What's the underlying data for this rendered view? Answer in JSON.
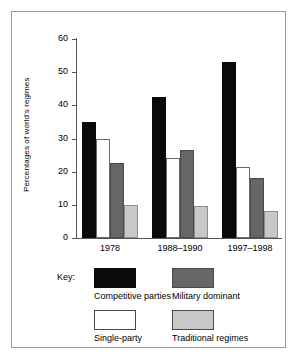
{
  "chart_data": {
    "type": "bar",
    "title": "",
    "xlabel": "",
    "ylabel": "Percentages of world's regimes",
    "categories": [
      "1978",
      "1988–1990",
      "1997–1998"
    ],
    "ylim": [
      0,
      60
    ],
    "yticks": [
      0,
      10,
      20,
      30,
      40,
      50,
      60
    ],
    "grid": false,
    "legend_position": "below-plot",
    "legend_title": "Key:",
    "series": [
      {
        "name": "Competitive parties",
        "color": "#0a0a0a",
        "values": [
          35,
          42.5,
          53
        ]
      },
      {
        "name": "Single-party",
        "color": "#ffffff",
        "values": [
          30,
          24,
          21.5
        ]
      },
      {
        "name": "Military dominant",
        "color": "#666666",
        "values": [
          22.5,
          26.5,
          18
        ]
      },
      {
        "name": "Traditional regimes",
        "color": "#c8c8c8",
        "values": [
          10,
          9.5,
          8
        ]
      }
    ]
  }
}
